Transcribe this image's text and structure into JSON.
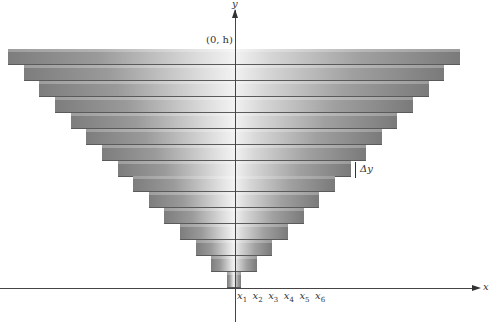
{
  "diagram": {
    "type": "stacked-slabs-inverted-pyramid",
    "axes": {
      "x_label": "x",
      "y_label": "y",
      "origin_px": {
        "x": 235,
        "y": 288
      }
    },
    "point_label": "(0, h)",
    "delta_label": "Δy",
    "x_ticks": [
      {
        "base": "x",
        "sub": "1"
      },
      {
        "base": "x",
        "sub": "2"
      },
      {
        "base": "x",
        "sub": "3"
      },
      {
        "base": "x",
        "sub": "4"
      },
      {
        "base": "x",
        "sub": "5"
      },
      {
        "base": "x",
        "sub": "6"
      }
    ],
    "slab_count": 15,
    "colors": {
      "axis": "#444444",
      "slab_dark": "#7d7d7d",
      "slab_light": "#f2f2f2"
    }
  }
}
